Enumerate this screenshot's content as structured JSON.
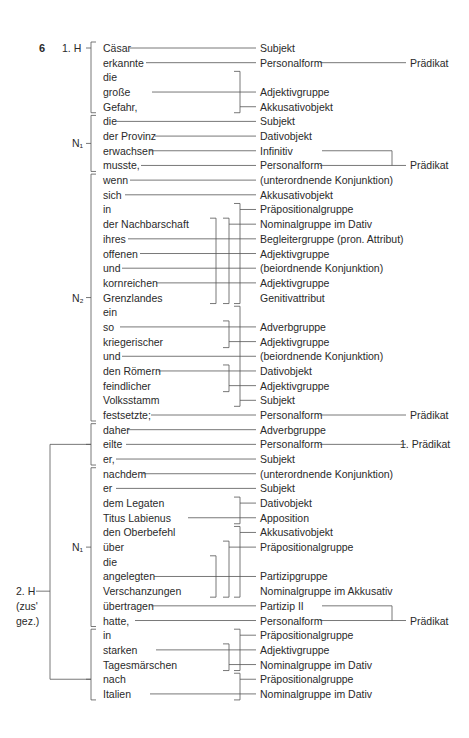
{
  "exercise_number": "6",
  "clause_labels": [
    {
      "id": "h1",
      "text": "1. H",
      "row": 0
    },
    {
      "id": "n1a",
      "text": "N₁",
      "row": 6.5
    },
    {
      "id": "n2",
      "text": "N₂",
      "row": 17
    },
    {
      "id": "n1b",
      "text": "N₁",
      "row": 34
    },
    {
      "id": "h2",
      "text": "2. H",
      "row": 37
    },
    {
      "id": "h2b",
      "text": "(zus'",
      "row": 38
    },
    {
      "id": "h2c",
      "text": "gez.)",
      "row": 39
    }
  ],
  "words": [
    "Cäsar",
    "erkannte",
    "die",
    "große",
    "Gefahr,",
    "die",
    "der Provinz",
    "erwachsen",
    "musste,",
    "wenn",
    "sich",
    "in",
    "der Nachbarschaft",
    "ihres",
    "offenen",
    "und",
    "kornreichen",
    "Grenzlandes",
    "ein",
    "so",
    "kriegerischer",
    "und",
    "den Römern",
    "feindlicher",
    "Volksstamm",
    "festsetzte;",
    "daher",
    "eilte",
    "er,",
    "nachdem",
    "er",
    "dem Legaten",
    "Titus Labienus",
    "den Oberbefehl",
    "über",
    "die",
    "angelegten",
    "Verschanzungen",
    "übertragen",
    "hatte,",
    "in",
    "starken",
    "Tagesmärschen",
    "nach",
    "Italien"
  ],
  "functions": [
    {
      "row": 0,
      "text": "Subjekt"
    },
    {
      "row": 1,
      "text": "Personalform"
    },
    {
      "row": 3,
      "text": "Adjektivgruppe"
    },
    {
      "row": 4,
      "text": "Akkusativobjekt"
    },
    {
      "row": 5,
      "text": "Subjekt"
    },
    {
      "row": 6,
      "text": "Dativobjekt"
    },
    {
      "row": 7,
      "text": "Infinitiv"
    },
    {
      "row": 8,
      "text": "Personalform"
    },
    {
      "row": 9,
      "text": "(unterordnende Konjunktion)"
    },
    {
      "row": 10,
      "text": "Akkusativobjekt"
    },
    {
      "row": 11,
      "text": "Präpositionalgruppe"
    },
    {
      "row": 12,
      "text": "Nominalgruppe im Dativ"
    },
    {
      "row": 13,
      "text": "Begleitergruppe (pron. Attribut)"
    },
    {
      "row": 14,
      "text": "Adjektivgruppe"
    },
    {
      "row": 15,
      "text": "(beiordnende Konjunktion)"
    },
    {
      "row": 16,
      "text": "Adjektivgruppe"
    },
    {
      "row": 17,
      "text": "Genitivattribut"
    },
    {
      "row": 19,
      "text": "Adverbgruppe"
    },
    {
      "row": 20,
      "text": "Adjektivgruppe"
    },
    {
      "row": 21,
      "text": "(beiordnende Konjunktion)"
    },
    {
      "row": 22,
      "text": "Dativobjekt"
    },
    {
      "row": 23,
      "text": "Adjektivgruppe"
    },
    {
      "row": 24,
      "text": "Subjekt"
    },
    {
      "row": 25,
      "text": "Personalform"
    },
    {
      "row": 26,
      "text": "Adverbgruppe"
    },
    {
      "row": 27,
      "text": "Personalform"
    },
    {
      "row": 28,
      "text": "Subjekt"
    },
    {
      "row": 29,
      "text": "(unterordnende Konjunktion)"
    },
    {
      "row": 30,
      "text": "Subjekt"
    },
    {
      "row": 31,
      "text": "Dativobjekt"
    },
    {
      "row": 32,
      "text": "Apposition"
    },
    {
      "row": 33,
      "text": "Akkusativobjekt"
    },
    {
      "row": 34,
      "text": "Präpositionalgruppe"
    },
    {
      "row": 36,
      "text": "Partizipgruppe"
    },
    {
      "row": 37,
      "text": "Nominalgruppe im Akkusativ"
    },
    {
      "row": 38,
      "text": "Partizip II"
    },
    {
      "row": 39,
      "text": "Personalform"
    },
    {
      "row": 40,
      "text": "Präpositionalgruppe"
    },
    {
      "row": 41,
      "text": "Adjektivgruppe"
    },
    {
      "row": 42,
      "text": "Nominalgruppe im Dativ"
    },
    {
      "row": 43,
      "text": "Präpositionalgruppe"
    },
    {
      "row": 44,
      "text": "Nominalgruppe im Dativ"
    }
  ],
  "predicates": [
    {
      "row": 1,
      "text": "Prädikat"
    },
    {
      "row": 8,
      "text": "Prädikat"
    },
    {
      "row": 25,
      "text": "Prädikat"
    },
    {
      "row": 27,
      "text": "1. Prädikat"
    },
    {
      "row": 39,
      "text": "Prädikat"
    }
  ],
  "direct_connectors": [
    {
      "row": 0,
      "from": 130
    },
    {
      "row": 1,
      "from": 146
    },
    {
      "row": 3,
      "from": 152
    },
    {
      "row": 5,
      "from": 117
    },
    {
      "row": 6,
      "from": 155
    },
    {
      "row": 7,
      "from": 150
    },
    {
      "row": 8,
      "from": 141
    },
    {
      "row": 9,
      "from": 130
    },
    {
      "row": 10,
      "from": 125
    },
    {
      "row": 13,
      "from": 128
    },
    {
      "row": 14,
      "from": 140
    },
    {
      "row": 15,
      "from": 122
    },
    {
      "row": 16,
      "from": 156
    },
    {
      "row": 19,
      "from": 120
    },
    {
      "row": 21,
      "from": 122
    },
    {
      "row": 22,
      "from": 158
    },
    {
      "row": 25,
      "from": 151
    },
    {
      "row": 26,
      "from": 128
    },
    {
      "row": 27,
      "from": 126
    },
    {
      "row": 28,
      "from": 116
    },
    {
      "row": 29,
      "from": 143
    },
    {
      "row": 30,
      "from": 116
    },
    {
      "row": 32,
      "from": 188
    },
    {
      "row": 36,
      "from": 154
    },
    {
      "row": 38,
      "from": 151
    },
    {
      "row": 39,
      "from": 135
    },
    {
      "row": 41,
      "from": 156
    },
    {
      "row": 44,
      "from": 150
    }
  ],
  "brackets": [
    {
      "x": 240,
      "top": 2,
      "bottom": 4,
      "tick": 4
    },
    {
      "x": 240,
      "top": 11,
      "bottom": 17,
      "tick": 11
    },
    {
      "x": 229,
      "top": 12,
      "bottom": 17,
      "tick": 12
    },
    {
      "x": 216,
      "top": 12,
      "bottom": 17,
      "tick": null
    },
    {
      "x": 240,
      "top": 18,
      "bottom": 24,
      "tick": 24
    },
    {
      "x": 229,
      "top": 19,
      "bottom": 20,
      "tick": 20
    },
    {
      "x": 229,
      "top": 22,
      "bottom": 23,
      "tick": 23
    },
    {
      "x": 240,
      "top": 31,
      "bottom": 32,
      "tick": 31
    },
    {
      "x": 240,
      "top": 33,
      "bottom": 37,
      "tick": 33
    },
    {
      "x": 229,
      "top": 34,
      "bottom": 37,
      "tick": 34
    },
    {
      "x": 216,
      "top": 35,
      "bottom": 37,
      "tick": null
    },
    {
      "x": 240,
      "top": 40,
      "bottom": 42,
      "tick": 40
    },
    {
      "x": 229,
      "top": 41,
      "bottom": 42,
      "tick": 42
    },
    {
      "x": 240,
      "top": 43,
      "bottom": 44,
      "tick": 43
    }
  ],
  "predicate_brackets": [
    {
      "x": 392,
      "top": 7,
      "bottom": 8
    },
    {
      "x": 392,
      "top": 38,
      "bottom": 39
    }
  ],
  "clause_brackets": [
    {
      "top": 0,
      "bottom": 4,
      "mid": 0
    },
    {
      "top": 5,
      "bottom": 8,
      "mid": 6.5
    },
    {
      "top": 9,
      "bottom": 25,
      "mid": 17
    },
    {
      "top": 26,
      "bottom": 28,
      "mid": 27
    },
    {
      "top": 29,
      "bottom": 39,
      "mid": 34
    },
    {
      "top": 40,
      "bottom": 44,
      "mid": 43
    }
  ]
}
